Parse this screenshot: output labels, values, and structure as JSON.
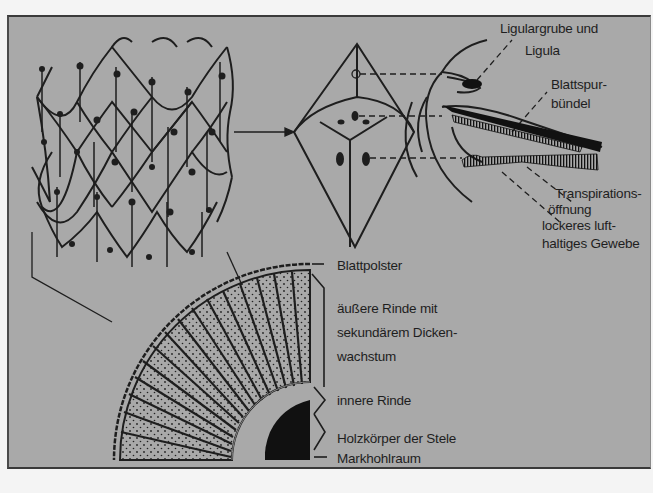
{
  "figure": {
    "panels": [
      "leaf-cushion-surface",
      "single-leaf-cushion",
      "leaf-base-longitudinal-section",
      "stem-cross-section"
    ]
  },
  "labels": {
    "ligula_1": "Ligulargrube und",
    "ligula_2": "Ligula",
    "blattspur_1": "Blattspur-",
    "blattspur_2": "bündel",
    "transpiration_1": "Transpirations-",
    "transpiration_2": "öffnung",
    "gewebe_1": "lockeres luft-",
    "gewebe_2": "haltiges Gewebe",
    "blattpolster": "Blattpolster",
    "rinde_1": "äußere Rinde mit",
    "rinde_2": "sekundärem Dicken-",
    "rinde_3": "wachstum",
    "innere_rinde": "innere Rinde",
    "holzkoerper": "Holzkörper der Stele",
    "markhohlraum": "Markhohlraum"
  },
  "colors": {
    "background": "#a9a9a9",
    "ink": "#1e1e1e",
    "page": "#f4f4f4"
  }
}
